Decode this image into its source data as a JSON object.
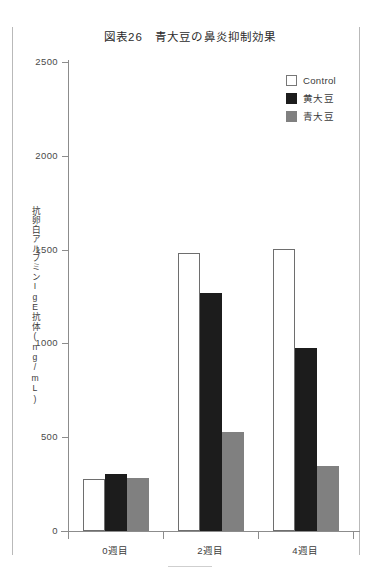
{
  "chart_data": {
    "type": "bar",
    "title": "図表26　青大豆の鼻炎抑制効果",
    "xlabel": "",
    "ylabel": "抗卵白アルブミンIgE抗体(ng/mL)",
    "categories": [
      "0週目",
      "2週目",
      "4週目"
    ],
    "series": [
      {
        "name": "Control",
        "color": "#ffffff",
        "values": [
          277,
          1480,
          1505
        ]
      },
      {
        "name": "黄大豆",
        "color": "#1c1c1c",
        "values": [
          303,
          1271,
          978
        ]
      },
      {
        "name": "青大豆",
        "color": "#808080",
        "values": [
          282,
          527,
          346
        ]
      }
    ],
    "ylim": [
      0,
      2500
    ],
    "yticks": [
      0,
      500,
      1000,
      1500,
      2000,
      2500
    ],
    "ytick_labels": [
      "0",
      "500",
      "1000",
      "1500",
      "2000",
      "2500"
    ],
    "grid": false,
    "legend_position": "top-right"
  },
  "legend": {
    "entries": [
      {
        "label": "Control",
        "swatch": "control"
      },
      {
        "label": "黄大豆",
        "swatch": "yellow"
      },
      {
        "label": "青大豆",
        "swatch": "green"
      }
    ]
  },
  "axes": {
    "y_caption": "抗卵白アルブミンIgE抗体(ng/mL)"
  }
}
